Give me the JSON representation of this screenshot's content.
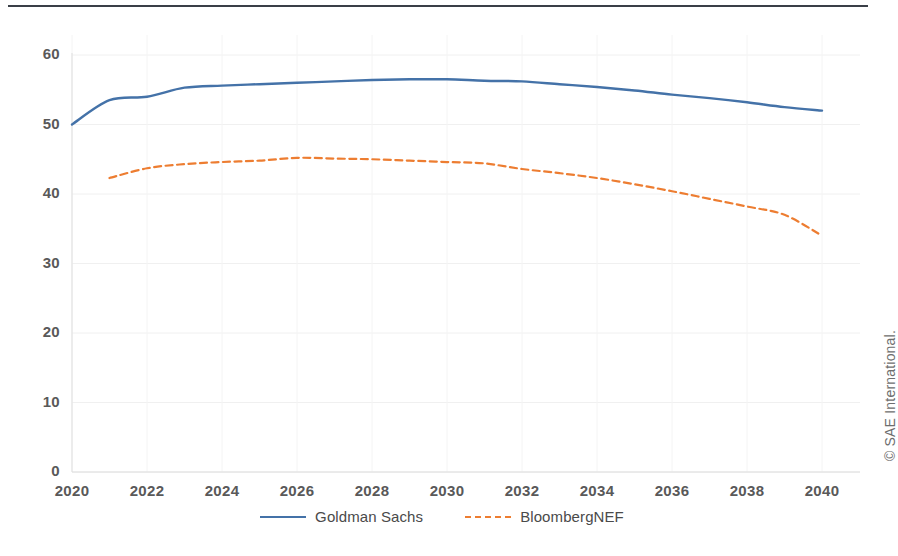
{
  "figure": {
    "copyright": "© SAE International.",
    "top_rule": true
  },
  "chart_data": {
    "type": "line",
    "title": "",
    "subtitle": "",
    "xlabel": "",
    "ylabel": "Demand (million barrels / day)",
    "xlim": [
      2020,
      2040
    ],
    "ylim": [
      0,
      60
    ],
    "yticks": [
      0,
      10,
      20,
      30,
      40,
      50,
      60
    ],
    "xticks": [
      2020,
      2022,
      2024,
      2026,
      2028,
      2030,
      2032,
      2034,
      2036,
      2038,
      2040
    ],
    "grid": true,
    "legend_position": "bottom-center",
    "colors": {
      "goldman_sachs": "#4472a8",
      "bloombergnef": "#ed7d31",
      "text": "#595959",
      "grid": "#f0f0f0",
      "rule": "#3a3f47"
    },
    "series": [
      {
        "name": "Goldman Sachs",
        "style": "solid",
        "color": "#4472a8",
        "x": [
          2020,
          2021,
          2022,
          2023,
          2024,
          2025,
          2026,
          2027,
          2028,
          2029,
          2030,
          2031,
          2032,
          2033,
          2034,
          2035,
          2036,
          2037,
          2038,
          2039,
          2040
        ],
        "values": [
          50.0,
          53.5,
          54.0,
          55.3,
          55.6,
          55.8,
          56.0,
          56.2,
          56.4,
          56.5,
          56.5,
          56.3,
          56.2,
          55.8,
          55.4,
          54.9,
          54.3,
          53.8,
          53.2,
          52.5,
          52.0
        ]
      },
      {
        "name": "BloombergNEF",
        "style": "dashed",
        "color": "#ed7d31",
        "x": [
          2021,
          2022,
          2023,
          2024,
          2025,
          2026,
          2027,
          2028,
          2029,
          2030,
          2031,
          2032,
          2033,
          2034,
          2035,
          2036,
          2037,
          2038,
          2039,
          2040
        ],
        "values": [
          42.3,
          43.7,
          44.3,
          44.6,
          44.8,
          45.2,
          45.1,
          45.0,
          44.8,
          44.6,
          44.4,
          43.6,
          43.0,
          42.3,
          41.4,
          40.4,
          39.3,
          38.2,
          37.0,
          34.0
        ]
      }
    ]
  },
  "legend": {
    "items": [
      {
        "label": "Goldman Sachs",
        "color": "#4472a8",
        "style": "solid"
      },
      {
        "label": "BloombergNEF",
        "color": "#ed7d31",
        "style": "dashed"
      }
    ]
  }
}
